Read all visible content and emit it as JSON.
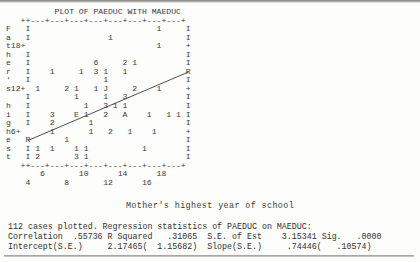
{
  "window": {
    "title": "PLOT OF PAEDUC WITH MAEDUC"
  },
  "chart_data": {
    "type": "scatter",
    "title": "PLOT OF PAEDUC WITH MAEDUC",
    "xlabel": "Mother's highest year of school",
    "ylabel": "Father's highest",
    "xlim": [
      3,
      19
    ],
    "ylim": [
      3,
      20
    ],
    "grid": false,
    "legend": null,
    "y_tick_labels": [
      "18+",
      "12+",
      "6+"
    ],
    "x_tick_labels_upper": [
      "6",
      "10",
      "14",
      "18"
    ],
    "x_tick_labels_lower": [
      "4",
      "8",
      "12",
      "16"
    ],
    "axis_left_label_chars": [
      "F",
      "a",
      "t",
      "h",
      "e",
      "r",
      "'",
      "s",
      "",
      "h",
      "i",
      "g",
      "h",
      "e",
      "s",
      "t"
    ],
    "overprint_codes": {
      "A": 10,
      "E": 14,
      "J": 19,
      "R": "regression line endpoint"
    },
    "regression_line": {
      "x_start": 4.0,
      "y_start": 5.2,
      "x_end": 18.6,
      "y_end": 16.0
    },
    "plot_rows": [
      "  ++---+---+---+---+---+---+---+---+",
      "  I                           1   I",
      "  I                 1             I",
      "18+                         1     +",
      "  I                               I",
      "  I              6     2 1        I",
      "  I     1     1  3 1   1          R",
      "  I                 1             I",
      "12+  1     2 1   1 J     2    1   +",
      "  I          1     1   3          I",
      "  I            1   3 1 1          I",
      "  I     3    E 1   2   A    1   1 1",
      "  I     2       1                 I",
      " 6+     1       1   2   1    1    +",
      "  R        1                      I",
      "  I  1  1    1 1           1      I",
      "  I  2       3 1                  I",
      "  ++---+---+---+---+---+---+---+---+"
    ]
  },
  "plot_marks": [
    {
      "ch": "1",
      "col": 30,
      "row": 1
    },
    {
      "ch": "1",
      "col": 20,
      "row": 2
    },
    {
      "ch": "1",
      "col": 30,
      "row": 3
    },
    {
      "ch": "6",
      "col": 17,
      "row": 5
    },
    {
      "ch": "2",
      "col": 23,
      "row": 5
    },
    {
      "ch": "1",
      "col": 25,
      "row": 5
    },
    {
      "ch": "1",
      "col": 8,
      "row": 6
    },
    {
      "ch": "1",
      "col": 14,
      "row": 6
    },
    {
      "ch": "3",
      "col": 17,
      "row": 6
    },
    {
      "ch": "1",
      "col": 19,
      "row": 6
    },
    {
      "ch": "1",
      "col": 23,
      "row": 6
    },
    {
      "ch": "1",
      "col": 19,
      "row": 7
    },
    {
      "ch": "1",
      "col": 5,
      "row": 8
    },
    {
      "ch": "2",
      "col": 11,
      "row": 8
    },
    {
      "ch": "1",
      "col": 13,
      "row": 8
    },
    {
      "ch": "1",
      "col": 17,
      "row": 8
    },
    {
      "ch": "J",
      "col": 19,
      "row": 8
    },
    {
      "ch": "2",
      "col": 25,
      "row": 8
    },
    {
      "ch": "1",
      "col": 30,
      "row": 8
    },
    {
      "ch": "1",
      "col": 13,
      "row": 9
    },
    {
      "ch": "1",
      "col": 19,
      "row": 9
    },
    {
      "ch": "3",
      "col": 23,
      "row": 9
    },
    {
      "ch": "1",
      "col": 15,
      "row": 10
    },
    {
      "ch": "3",
      "col": 19,
      "row": 10
    },
    {
      "ch": "1",
      "col": 21,
      "row": 10
    },
    {
      "ch": "1",
      "col": 23,
      "row": 10
    },
    {
      "ch": "3",
      "col": 8,
      "row": 11
    },
    {
      "ch": "E",
      "col": 13,
      "row": 11
    },
    {
      "ch": "1",
      "col": 15,
      "row": 11
    },
    {
      "ch": "2",
      "col": 19,
      "row": 11
    },
    {
      "ch": "A",
      "col": 23,
      "row": 11
    },
    {
      "ch": "1",
      "col": 28,
      "row": 11
    },
    {
      "ch": "1",
      "col": 32,
      "row": 11
    },
    {
      "ch": "1",
      "col": 34,
      "row": 11
    },
    {
      "ch": "2",
      "col": 8,
      "row": 12
    },
    {
      "ch": "1",
      "col": 16,
      "row": 12
    },
    {
      "ch": "1",
      "col": 8,
      "row": 13
    },
    {
      "ch": "1",
      "col": 16,
      "row": 13
    },
    {
      "ch": "2",
      "col": 20,
      "row": 13
    },
    {
      "ch": "1",
      "col": 24,
      "row": 13
    },
    {
      "ch": "1",
      "col": 29,
      "row": 13
    },
    {
      "ch": "1",
      "col": 11,
      "row": 14
    },
    {
      "ch": "1",
      "col": 5,
      "row": 15
    },
    {
      "ch": "1",
      "col": 8,
      "row": 15
    },
    {
      "ch": "1",
      "col": 13,
      "row": 15
    },
    {
      "ch": "1",
      "col": 15,
      "row": 15
    },
    {
      "ch": "1",
      "col": 27,
      "row": 15
    },
    {
      "ch": "2",
      "col": 5,
      "row": 16
    },
    {
      "ch": "3",
      "col": 13,
      "row": 16
    },
    {
      "ch": "1",
      "col": 15,
      "row": 16
    }
  ],
  "axis": {
    "title": "Mother's highest year of school"
  },
  "stats": {
    "line1": "112 cases plotted. Regression statistics of PAEDUC on MAEDUC:",
    "line2": "Correlation  .55736 R Squared   .31065  S.E. of Est    3.15341 Sig.   .0000",
    "line3": "Intercept(S.E.)     2.17465(  1.15682)  Slope(S.E.)     .74446(   .10574)",
    "cases_plotted": 112,
    "correlation": ".55736",
    "r_squared": ".31065",
    "se_of_est": "3.15341",
    "sig": ".0000",
    "intercept": "2.17465",
    "intercept_se": "1.15682",
    "slope": ".74446",
    "slope_se": ".10574"
  },
  "colors": {
    "ink": "#3a3a3a",
    "paper": "#fdfdfb",
    "rule": "#9a9a9a"
  }
}
